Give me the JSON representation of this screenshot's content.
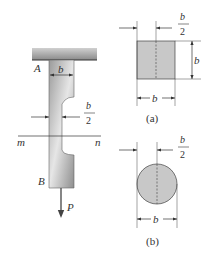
{
  "figure": {
    "bar": {
      "top_label": "A",
      "bottom_label": "B",
      "width_label": "b",
      "neck_label_num": "b",
      "neck_label_den": "2",
      "section_left": "m",
      "section_right": "n",
      "load_label": "P"
    },
    "section_a": {
      "caption": "(a)",
      "offset_num": "b",
      "offset_den": "2",
      "height_label": "b",
      "width_label": "b",
      "shape": "square"
    },
    "section_b": {
      "caption": "(b)",
      "offset_num": "b",
      "offset_den": "2",
      "width_label": "b",
      "shape": "circle"
    },
    "colors": {
      "fill": "#c8c8c8",
      "stroke": "#444444",
      "support": "#a0a0a0"
    }
  }
}
